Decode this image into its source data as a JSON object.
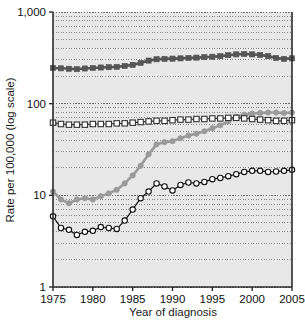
{
  "chart_data": {
    "type": "line",
    "title": "",
    "subtitle": "",
    "xlabel": "Year of diagnosis",
    "ylabel": "Rate per 100,000 (log scale)",
    "yscale": "log",
    "ylim": [
      1,
      1000
    ],
    "xlim": [
      1975,
      2005
    ],
    "grid": true,
    "minor_grid": true,
    "legend": "none",
    "y_ticks": [
      1,
      10,
      100,
      1000
    ],
    "y_tick_labels": [
      "1",
      "10",
      "100",
      "1,000"
    ],
    "x_ticks": [
      1975,
      1980,
      1985,
      1990,
      1995,
      2000,
      2005
    ],
    "x_tick_labels": [
      "1975",
      "1980",
      "1985",
      "1990",
      "1995",
      "2000",
      "2005"
    ],
    "x": [
      1975,
      1976,
      1977,
      1978,
      1979,
      1980,
      1981,
      1982,
      1983,
      1984,
      1985,
      1986,
      1987,
      1988,
      1989,
      1990,
      1991,
      1992,
      1993,
      1994,
      1995,
      1996,
      1997,
      1998,
      1999,
      2000,
      2001,
      2002,
      2003,
      2004,
      2005
    ],
    "series": [
      {
        "name": "dark-filled-squares",
        "marker": "filled-square",
        "color": "#555555",
        "line_color": "#555555",
        "values": [
          245,
          243,
          240,
          238,
          242,
          245,
          248,
          250,
          252,
          258,
          265,
          278,
          295,
          305,
          308,
          310,
          312,
          315,
          318,
          322,
          325,
          330,
          338,
          345,
          348,
          345,
          340,
          330,
          315,
          308,
          312
        ]
      },
      {
        "name": "gray-filled-circles",
        "marker": "filled-circle",
        "color": "#9a9a9a",
        "line_color": "#9a9a9a",
        "values": [
          11.0,
          9.0,
          8.2,
          9.0,
          9.3,
          9.0,
          9.8,
          10.5,
          11.5,
          13.5,
          16.5,
          21.0,
          28.0,
          36.0,
          38.0,
          39.0,
          42.0,
          45.0,
          47.0,
          50.0,
          54.0,
          58.0,
          64.0,
          72.0,
          76.0,
          78.0,
          79.0,
          80.0,
          80.0,
          79.0,
          80.0
        ]
      },
      {
        "name": "open-white-squares",
        "marker": "open-square",
        "color": "#ffffff",
        "line_color": "#333333",
        "values": [
          62,
          60,
          59,
          59,
          59,
          60,
          60,
          60,
          61,
          61,
          62,
          63,
          64,
          65,
          65,
          66,
          67,
          67,
          68,
          68,
          69,
          69,
          70,
          70,
          69,
          68,
          67,
          66,
          65,
          65,
          66
        ]
      },
      {
        "name": "open-white-circles",
        "marker": "open-circle",
        "color": "#ffffff",
        "line_color": "#111111",
        "values": [
          5.9,
          4.4,
          4.2,
          3.7,
          4.0,
          4.1,
          4.5,
          4.4,
          4.3,
          5.3,
          7.0,
          9.3,
          11.0,
          13.5,
          12.5,
          11.3,
          13.0,
          13.8,
          13.5,
          14.0,
          15.0,
          15.5,
          16.2,
          17.0,
          18.0,
          18.5,
          18.5,
          18.0,
          18.2,
          18.5,
          19.0
        ]
      }
    ]
  },
  "plot": {
    "background_color": "#e8e8e8",
    "axis_color": "#2b2b2b",
    "grid_color": "#6e6e6e"
  }
}
